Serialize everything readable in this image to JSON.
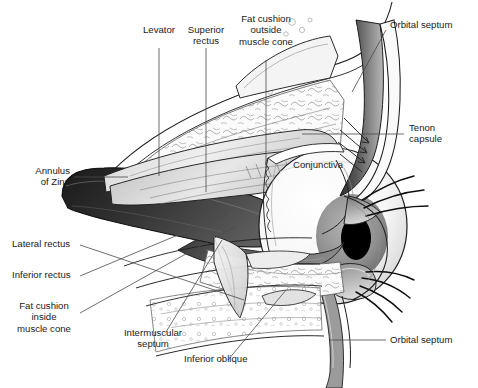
{
  "figure": {
    "background_color": "#ffffff",
    "text_color": "#1a1a1a",
    "leader_line_color": "#4a4a4a",
    "width": 478,
    "height": 388
  },
  "labels": {
    "levator": "Levator",
    "superior_rectus": "Superior\nrectus",
    "fat_cushion_outside": "Fat cushion\noutside\nmuscle cone",
    "orbital_septum_top": "Orbital septum",
    "tenon_capsule": "Tenon\ncapsule",
    "conjunctiva": "Conjunctiva",
    "annulus_of_zinn": "Annulus\nof Zinn",
    "lateral_rectus": "Lateral rectus",
    "inferior_rectus": "Inferior rectus",
    "fat_cushion_inside": "Fat cushion\ninside\nmuscle cone",
    "intermuscular_septum": "Intermuscular\nseptum",
    "inferior_oblique": "Inferior oblique",
    "orbital_septum_bottom": "Orbital septum"
  },
  "palette": {
    "outline": "#1d1d1d",
    "muscle_dark": "#2b2b2b",
    "muscle_mid": "#6e6e6e",
    "fat_light": "#f2f2f2",
    "sclera": "#fbfbfb",
    "iris": "#9a9a9a",
    "pupil": "#000000",
    "lid_shade": "#8d8d8d",
    "septum_shade": "#555555"
  }
}
